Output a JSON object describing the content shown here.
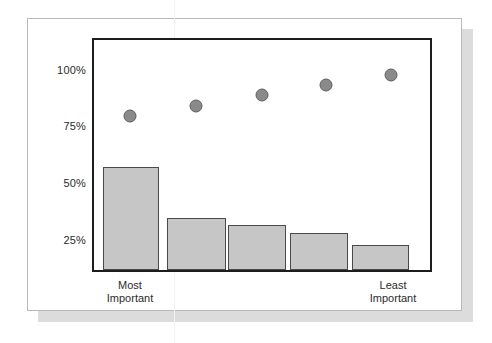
{
  "figure": {
    "background_color": "#ffffff",
    "card_border_color": "#b9b9b9",
    "shadow_color": "#dcdcdc",
    "frame_color": "#1d1d1d",
    "bar_fill_color": "#c6c6c6",
    "bar_edge_color": "#4a4a4a",
    "dot_fill_color": "#8a8a8a",
    "dot_edge_color": "#5e5e5e"
  },
  "chart_data": {
    "type": "bar",
    "title": "",
    "subtitle": "",
    "xlabel": "",
    "ylabel": "",
    "grid": false,
    "legend": null,
    "ylim": [
      0,
      112
    ],
    "ytick_labels": [
      "100%",
      "75%",
      "50%",
      "25%"
    ],
    "ytick_values": [
      100,
      75,
      50,
      25
    ],
    "categories": [
      "1",
      "2",
      "3",
      "4",
      "5"
    ],
    "category_labels": [
      {
        "line1": "Most",
        "line2": "Important"
      },
      {
        "line1": "",
        "line2": ""
      },
      {
        "line1": "",
        "line2": ""
      },
      {
        "line1": "",
        "line2": ""
      },
      {
        "line1": "Least",
        "line2": "Important"
      }
    ],
    "series": [
      {
        "name": "Percent selecting rank",
        "type": "bar",
        "values": [
          50,
          25.5,
          22,
          18,
          12
        ]
      },
      {
        "name": "Cumulative percent",
        "type": "scatter",
        "values": [
          75,
          80,
          85,
          90,
          95
        ]
      }
    ]
  },
  "axis": {
    "tick_0": "100%",
    "tick_1": "75%",
    "tick_2": "50%",
    "tick_3": "25%"
  },
  "xlabels": {
    "left_line1": "Most",
    "left_line2": "Important",
    "right_line1": "Least",
    "right_line2": "Important"
  }
}
